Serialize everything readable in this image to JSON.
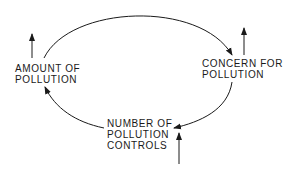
{
  "diagram": {
    "type": "causal-loop",
    "nodes": [
      {
        "id": "amount",
        "lines": [
          "AMOUNT OF",
          "POLLUTION"
        ]
      },
      {
        "id": "concern",
        "lines": [
          "CONCERN FOR",
          "POLLUTION"
        ]
      },
      {
        "id": "controls",
        "lines": [
          "NUMBER OF",
          "POLLUTION",
          "CONTROLS"
        ]
      }
    ],
    "edges": [
      {
        "from": "amount",
        "to": "concern"
      },
      {
        "from": "concern",
        "to": "controls"
      },
      {
        "from": "controls",
        "to": "amount"
      }
    ],
    "external_inputs": [
      "amount",
      "concern",
      "controls"
    ],
    "stroke_color": "#1a1a1a"
  }
}
